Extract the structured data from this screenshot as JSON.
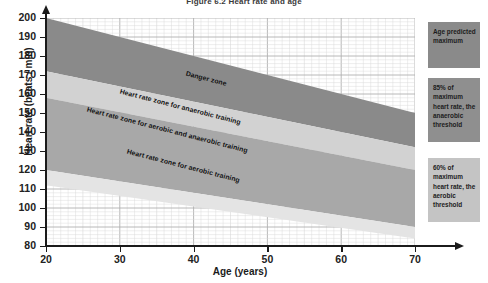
{
  "figure": {
    "title": "Figure 6.2 Heart rate and age"
  },
  "axes": {
    "x": {
      "title": "Age (years)",
      "ticks": [
        20,
        30,
        40,
        50,
        60,
        70
      ],
      "min": 20,
      "max": 70
    },
    "y": {
      "title": "Heart rate (beats / min)",
      "ticks": [
        200,
        190,
        180,
        170,
        160,
        150,
        140,
        130,
        120,
        110,
        100,
        90,
        80
      ],
      "min": 80,
      "max": 200
    }
  },
  "zone_labels": [
    {
      "id": "danger",
      "text": "Danger zone"
    },
    {
      "id": "anaerobic",
      "text": "Heart rate zone for anaerobic training"
    },
    {
      "id": "aerobic-anaerobic",
      "text": "Heart rate zone for aerobic and anaerobic training"
    },
    {
      "id": "aerobic",
      "text": "Heart rate zone for aerobic training"
    }
  ],
  "legend": [
    {
      "id": "age-predicted-maximum",
      "text": "Age predicted maximum",
      "color": "#8a8a8a"
    },
    {
      "id": "anaerobic-threshold",
      "text": "85% of maximum heart rate, the anaerobic threshold",
      "color": "#8f8f8f"
    },
    {
      "id": "aerobic-threshold",
      "text": "60% of maximum heart rate, the aerobic threshold",
      "color": "#c4c4c4"
    }
  ],
  "colors": {
    "danger_band": "#8a8a8a",
    "anaerobic_band": "#d2d2d2",
    "mixed_band": "#a8a8a8",
    "aerobic_band": "#e4e4e4",
    "grid_minor": "#d8d8d8",
    "grid_major": "#b0b0b0",
    "axis": "#1b1b1b",
    "plot_background": "#ffffff"
  },
  "chart_data": {
    "type": "area",
    "title": "Figure 6.2 Heart rate and age",
    "xlabel": "Age (years)",
    "ylabel": "Heart rate (beats / min)",
    "xlim": [
      20,
      70
    ],
    "ylim": [
      80,
      200
    ],
    "grid": true,
    "legend_position": "right",
    "x": [
      20,
      70
    ],
    "series": [
      {
        "name": "Age predicted maximum (100% of max HR, 220 - age)",
        "values": [
          200,
          150
        ],
        "role": "upper-boundary"
      },
      {
        "name": "Upper edge of anaerobic training band",
        "values": [
          172,
          132
        ],
        "role": "band-boundary"
      },
      {
        "name": "85% of maximum heart rate, the anaerobic threshold",
        "values": [
          170,
          128
        ],
        "role": "threshold"
      },
      {
        "name": "Lower edge of anaerobic training band",
        "values": [
          158,
          120
        ],
        "role": "band-boundary"
      },
      {
        "name": "60% of maximum heart rate, the aerobic threshold",
        "values": [
          120,
          90
        ],
        "role": "threshold"
      },
      {
        "name": "Lower edge of aerobic training band",
        "values": [
          112,
          84
        ],
        "role": "band-boundary"
      }
    ],
    "bands": [
      {
        "name": "Danger zone",
        "upper": [
          200,
          150
        ],
        "lower": [
          172,
          132
        ],
        "color": "#8a8a8a"
      },
      {
        "name": "Heart rate zone for anaerobic training",
        "upper": [
          172,
          132
        ],
        "lower": [
          158,
          120
        ],
        "color": "#d2d2d2"
      },
      {
        "name": "Heart rate zone for aerobic and anaerobic training",
        "upper": [
          158,
          120
        ],
        "lower": [
          120,
          90
        ],
        "color": "#a8a8a8"
      },
      {
        "name": "Heart rate zone for aerobic training",
        "upper": [
          120,
          90
        ],
        "lower": [
          112,
          84
        ],
        "color": "#e4e4e4"
      }
    ]
  }
}
